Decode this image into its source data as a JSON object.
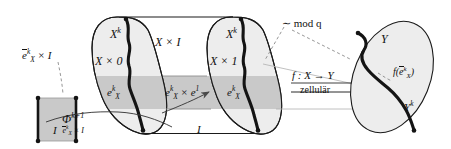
{
  "figure": {
    "colors": {
      "fill_gray": "#c9c9c9",
      "fill_light": "#ededed",
      "stroke": "#1a1a1a",
      "dashed": "#8a8a8a",
      "thin": "#9a9a9a"
    }
  },
  "labels": {
    "ebar_times_I": {
      "base": "e",
      "overline": true,
      "sub": "X",
      "sup": "k",
      "tail": " × I"
    },
    "left_square_I": "I",
    "phi_main": "Φ",
    "phi_sup": "k+1",
    "phi_sub": {
      "base": "e",
      "overline": true,
      "sub": "X",
      "sup": "k",
      "tail": " × I"
    },
    "X_k_left": {
      "base": "X",
      "sup": "k"
    },
    "X_times_0": "X × 0",
    "e_X_k_left": {
      "base": "e",
      "sub": "X",
      "sup": "k"
    },
    "X_times_I": "X × I",
    "e_X_k_times_e1": {
      "base": "e",
      "sub": "X",
      "sup": "k",
      "tail": " × e",
      "tail_sup": "1"
    },
    "X_k_right": {
      "base": "X",
      "sup": "k"
    },
    "X_times_1": "X × 1",
    "e_X_k_right": {
      "base": "e",
      "sub": "X",
      "sup": "k"
    },
    "bottom_I": "I",
    "mod_q": "∼  mod q",
    "f_map": "f : X → Y",
    "zellulaer": "zellulär",
    "Y": "Y",
    "f_ebar": {
      "prefix": "f(",
      "base": "e",
      "overline": true,
      "sub": "X",
      "sup": "k",
      "suffix": ")"
    },
    "Y_k": {
      "base": "Y",
      "sup": "k"
    }
  }
}
